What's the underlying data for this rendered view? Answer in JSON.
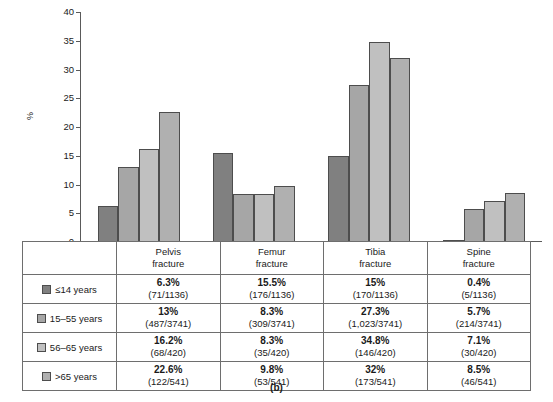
{
  "caption": "(b)",
  "chart_data": {
    "type": "bar",
    "title": "",
    "xlabel": "",
    "ylabel": "%",
    "ylim": [
      0,
      40
    ],
    "yticks": [
      0,
      5,
      10,
      15,
      20,
      25,
      30,
      35,
      40
    ],
    "grid": false,
    "legend_position": "table-below",
    "categories": [
      "Pelvis fracture",
      "Femur fracture",
      "Tibia fracture",
      "Spine fracture"
    ],
    "series": [
      {
        "name": "≤14 years",
        "color": "#808080",
        "values": [
          6.3,
          15.5,
          15.0,
          0.4
        ]
      },
      {
        "name": "15–55 years",
        "color": "#a6a6a6",
        "values": [
          13.0,
          8.3,
          27.3,
          5.7
        ]
      },
      {
        "name": "56–65 years",
        "color": "#c0c0c0",
        "values": [
          16.2,
          8.3,
          34.8,
          7.1
        ]
      },
      {
        "name": ">65 years",
        "color": "#b0b0b0",
        "values": [
          22.6,
          9.8,
          32.0,
          8.5
        ]
      }
    ]
  },
  "table": {
    "corner_label": "",
    "columns": [
      {
        "line1": "Pelvis",
        "line2": "fracture"
      },
      {
        "line1": "Femur",
        "line2": "fracture"
      },
      {
        "line1": "Tibia",
        "line2": "fracture"
      },
      {
        "line1": "Spine",
        "line2": "fracture"
      }
    ],
    "rows": [
      {
        "label": "≤14 years",
        "color": "#808080",
        "cells": [
          {
            "pct": "6.3%",
            "frac": "(71/1136)"
          },
          {
            "pct": "15.5%",
            "frac": "(176/1136)"
          },
          {
            "pct": "15%",
            "frac": "(170/1136)"
          },
          {
            "pct": "0.4%",
            "frac": "(5/1136)"
          }
        ]
      },
      {
        "label": "15–55 years",
        "color": "#a6a6a6",
        "cells": [
          {
            "pct": "13%",
            "frac": "(487/3741)"
          },
          {
            "pct": "8.3%",
            "frac": "(309/3741)"
          },
          {
            "pct": "27.3%",
            "frac": "(1,023/3741)"
          },
          {
            "pct": "5.7%",
            "frac": "(214/3741)"
          }
        ]
      },
      {
        "label": "56–65 years",
        "color": "#c0c0c0",
        "cells": [
          {
            "pct": "16.2%",
            "frac": "(68/420)"
          },
          {
            "pct": "8.3%",
            "frac": "(35/420)"
          },
          {
            "pct": "34.8%",
            "frac": "(146/420)"
          },
          {
            "pct": "7.1%",
            "frac": "(30/420)"
          }
        ]
      },
      {
        "label": ">65 years",
        "color": "#b0b0b0",
        "cells": [
          {
            "pct": "22.6%",
            "frac": "(122/541)"
          },
          {
            "pct": "9.8%",
            "frac": "(53/541)"
          },
          {
            "pct": "32%",
            "frac": "(173/541)"
          },
          {
            "pct": "8.5%",
            "frac": "(46/541)"
          }
        ]
      }
    ]
  }
}
